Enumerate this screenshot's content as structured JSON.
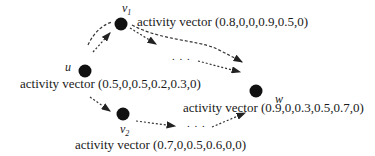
{
  "nodes": {
    "v1": {
      "name": "v",
      "sub": "1",
      "label": "activity vector (0.8,0,0,0.9,0.5,0)"
    },
    "u": {
      "name": "u",
      "label": "activity vector (0.5,0,0.5,0.2,0.3,0)"
    },
    "v2": {
      "name": "v",
      "sub": "2",
      "label": "activity vector (0.7,0,0.5,0.6,0,0)"
    },
    "w": {
      "name": "w",
      "label": "activity vector (0.9,0,0.3,0.5,0.7,0)"
    }
  },
  "ellipsis": {
    "upper": ". . .",
    "lower": ". . ."
  }
}
